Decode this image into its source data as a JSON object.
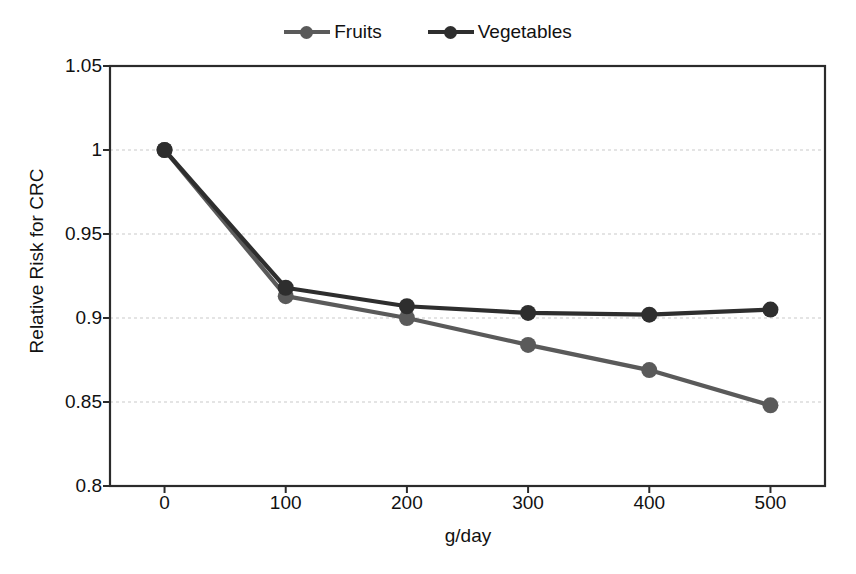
{
  "chart_data": {
    "type": "line",
    "title": "",
    "xlabel": "g/day",
    "ylabel": "Relative Risk for CRC",
    "x": [
      0,
      100,
      200,
      300,
      400,
      500
    ],
    "xtick_labels": [
      "0",
      "100",
      "200",
      "300",
      "400",
      "500"
    ],
    "ytick_labels": [
      "1.05",
      "1",
      "0.95",
      "0.9",
      "0.85",
      "0.8"
    ],
    "ytick_values": [
      1.05,
      1,
      0.95,
      0.9,
      0.85,
      0.8
    ],
    "xlim": [
      -45,
      545
    ],
    "ylim": [
      0.8,
      1.05
    ],
    "grid": "horizontal-dashed",
    "legend_position": "top-center",
    "series": [
      {
        "name": "Fruits",
        "color": "#5a5a5a",
        "marker": "circle",
        "values": [
          1.0,
          0.913,
          0.9,
          0.884,
          0.869,
          0.848
        ]
      },
      {
        "name": "Vegetables",
        "color": "#2e2e2e",
        "marker": "circle",
        "values": [
          1.0,
          0.918,
          0.907,
          0.903,
          0.902,
          0.905
        ]
      }
    ]
  },
  "colors": {
    "fruits": "#5a5a5a",
    "vegetables": "#2e2e2e",
    "axis": "#2b2b2b",
    "grid": "#c9c9c9",
    "background": "#ffffff"
  }
}
